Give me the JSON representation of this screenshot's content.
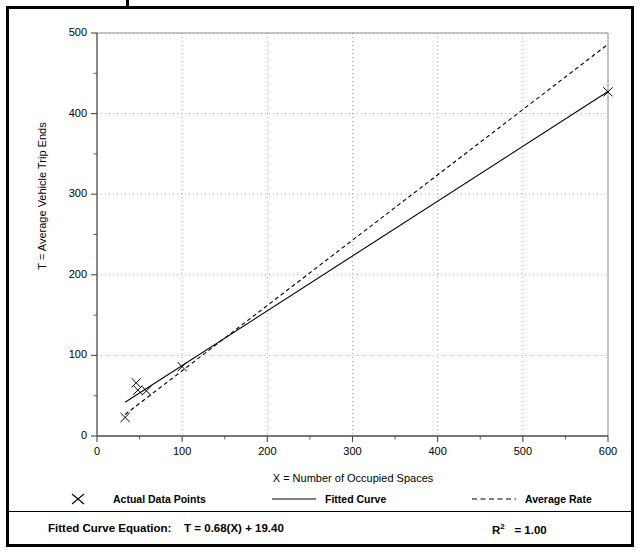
{
  "figure": {
    "frame_color": "#000000",
    "background": "#ffffff"
  },
  "axis": {
    "x_title": "X = Number of Occupied Spaces",
    "y_title": "T = Average Vehicle Trip Ends",
    "x_ticks": [
      "0",
      "100",
      "200",
      "300",
      "400",
      "500",
      "600"
    ],
    "y_ticks": [
      "0",
      "100",
      "200",
      "300",
      "400",
      "500"
    ]
  },
  "legend": {
    "items": [
      {
        "label": "Actual Data Points",
        "marker": "x-marker-icon",
        "style": "marker"
      },
      {
        "label": "Fitted Curve",
        "marker": "solid-line-icon",
        "style": "solid"
      },
      {
        "label": "Average Rate",
        "marker": "dashed-line-icon",
        "style": "dashed"
      }
    ]
  },
  "footer": {
    "equation_label": "Fitted Curve Equation:",
    "equation": "T = 0.68(X) + 19.40",
    "r_squared_label": "R",
    "r_squared_exp": "2",
    "r_squared_value": "= 1.00"
  },
  "chart_data": {
    "type": "scatter",
    "title": "",
    "xlabel": "X = Number of Occupied Spaces",
    "ylabel": "T = Average Vehicle Trip Ends",
    "xlim": [
      0,
      600
    ],
    "ylim": [
      0,
      500
    ],
    "xticks": [
      0,
      100,
      200,
      300,
      400,
      500,
      600
    ],
    "yticks": [
      0,
      100,
      200,
      300,
      400,
      500
    ],
    "x_minor_step": 50,
    "y_minor_step": 50,
    "grid": "dotted-major",
    "legend_position": "below-axes",
    "series": [
      {
        "name": "Actual Data Points",
        "type": "scatter",
        "marker": "x",
        "color": "#000000",
        "points": [
          {
            "x": 33,
            "y": 23
          },
          {
            "x": 46,
            "y": 66
          },
          {
            "x": 48,
            "y": 57
          },
          {
            "x": 58,
            "y": 56
          },
          {
            "x": 100,
            "y": 86
          },
          {
            "x": 600,
            "y": 427
          }
        ]
      },
      {
        "name": "Fitted Curve",
        "type": "line",
        "style": "solid",
        "color": "#000000",
        "equation": "T = 0.68(X) + 19.40",
        "slope": 0.68,
        "intercept": 19.4,
        "r_squared": 1.0,
        "x_range": [
          33,
          600
        ],
        "endpoints": [
          {
            "x": 33,
            "y": 41.8
          },
          {
            "x": 600,
            "y": 427.4
          }
        ]
      },
      {
        "name": "Average Rate",
        "type": "line",
        "style": "dashed",
        "color": "#000000",
        "slope": 0.81,
        "intercept": 0,
        "x_range": [
          33,
          600
        ],
        "endpoints": [
          {
            "x": 33,
            "y": 26.7
          },
          {
            "x": 600,
            "y": 486
          }
        ]
      }
    ]
  }
}
